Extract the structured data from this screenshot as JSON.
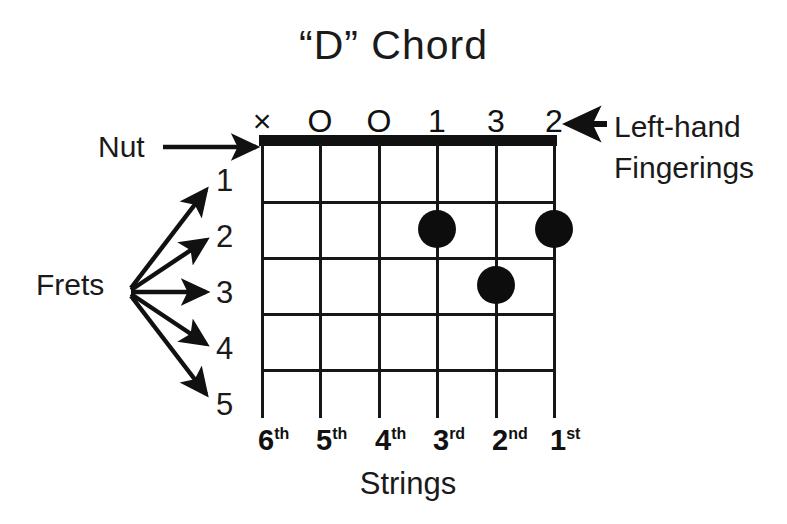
{
  "title": "“D” Chord",
  "labels": {
    "nut": "Nut",
    "frets": "Frets",
    "strings_caption": "Strings",
    "left_hand_line1": "Left-hand",
    "left_hand_line2": "Fingerings"
  },
  "fingerings": [
    {
      "string": 6,
      "marker": "×",
      "meaning": "muted"
    },
    {
      "string": 5,
      "marker": "O",
      "meaning": "open"
    },
    {
      "string": 4,
      "marker": "O",
      "meaning": "open"
    },
    {
      "string": 3,
      "marker": "1",
      "meaning": "index-finger"
    },
    {
      "string": 2,
      "marker": "3",
      "meaning": "ring-finger"
    },
    {
      "string": 1,
      "marker": "2",
      "meaning": "middle-finger"
    }
  ],
  "fret_numbers": [
    "1",
    "2",
    "3",
    "4",
    "5"
  ],
  "string_labels": [
    {
      "number": "6",
      "ordinal": "th"
    },
    {
      "number": "5",
      "ordinal": "th"
    },
    {
      "number": "4",
      "ordinal": "th"
    },
    {
      "number": "3",
      "ordinal": "rd"
    },
    {
      "number": "2",
      "ordinal": "nd"
    },
    {
      "number": "1",
      "ordinal": "st"
    }
  ],
  "dots": [
    {
      "string": 3,
      "fret": 2,
      "finger": "1"
    },
    {
      "string": 1,
      "fret": 2,
      "finger": "2"
    },
    {
      "string": 2,
      "fret": 3,
      "finger": "3"
    }
  ],
  "diagram": {
    "string_count": 6,
    "fret_count": 5,
    "colors": {
      "ink": "#111111",
      "background": "#ffffff"
    }
  }
}
